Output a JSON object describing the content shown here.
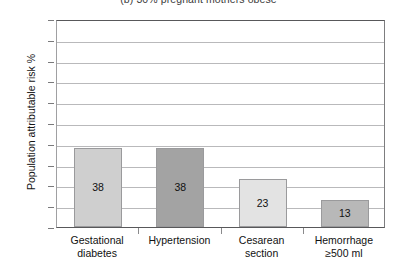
{
  "chart_data": {
    "type": "bar",
    "title": "(b) 30% pregnant mothers obese",
    "xlabel": "",
    "ylabel": "Population attributable risk %",
    "ylim": [
      0,
      100
    ],
    "ytick_step": 10,
    "yticks": [
      "100",
      "90",
      "80",
      "70",
      "60",
      "50",
      "40",
      "30",
      "20",
      "10",
      "0"
    ],
    "grid": true,
    "legend": "none",
    "categories": [
      "Gestational diabetes",
      "Hypertension",
      "Cesarean section",
      "Hemorrhage ≥500 ml"
    ],
    "category_lines": [
      [
        "Gestational",
        "diabetes"
      ],
      [
        "Hypertension",
        ""
      ],
      [
        "Cesarean",
        "section"
      ],
      [
        "Hemorrhage",
        "≥500 ml"
      ]
    ],
    "values": [
      38,
      38,
      23,
      13
    ],
    "value_labels": [
      "38",
      "38",
      "23",
      "13"
    ],
    "bar_colors": [
      "#cfcfcf",
      "#a3a3a3",
      "#e3e3e3",
      "#b8b8b8"
    ],
    "bar_border_color": "#9a9a9c",
    "axis_color": "#58585a",
    "gridline_color": "#b9b9bb",
    "background": "#ffffff"
  }
}
